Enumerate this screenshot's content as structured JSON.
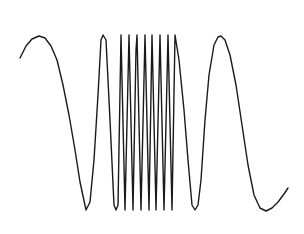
{
  "chart_data": {
    "type": "line",
    "title": "",
    "xlabel": "",
    "ylabel": "",
    "grid": false,
    "legend": null,
    "axes_visible": false,
    "line_color": "#1a1a1a",
    "background": "#ffffff",
    "pixel_frame": {
      "width": 304,
      "height": 234
    },
    "series": [
      {
        "name": "signal",
        "points": [
          [
            20,
            58
          ],
          [
            26,
            46
          ],
          [
            32,
            39
          ],
          [
            39,
            36
          ],
          [
            45,
            38
          ],
          [
            51,
            46
          ],
          [
            57,
            60
          ],
          [
            63,
            85
          ],
          [
            69,
            115
          ],
          [
            75,
            150
          ],
          [
            80,
            182
          ],
          [
            86,
            210
          ],
          [
            90,
            202
          ],
          [
            94,
            160
          ],
          [
            98,
            95
          ],
          [
            101,
            40
          ],
          [
            103,
            35
          ],
          [
            106,
            40
          ],
          [
            110,
            120
          ],
          [
            114,
            205
          ],
          [
            116,
            210
          ],
          [
            118,
            205
          ],
          [
            121,
            35
          ],
          [
            125,
            210
          ],
          [
            129,
            35
          ],
          [
            133,
            210
          ],
          [
            136,
            50
          ],
          [
            137,
            35
          ],
          [
            141,
            210
          ],
          [
            145,
            35
          ],
          [
            149,
            210
          ],
          [
            152,
            35
          ],
          [
            156,
            210
          ],
          [
            160,
            35
          ],
          [
            164,
            210
          ],
          [
            168,
            35
          ],
          [
            172,
            210
          ],
          [
            175,
            35
          ],
          [
            179,
            60
          ],
          [
            184,
            110
          ],
          [
            188,
            160
          ],
          [
            192,
            205
          ],
          [
            195,
            210
          ],
          [
            198,
            205
          ],
          [
            201,
            180
          ],
          [
            205,
            120
          ],
          [
            209,
            75
          ],
          [
            214,
            45
          ],
          [
            218,
            37
          ],
          [
            221,
            36
          ],
          [
            225,
            40
          ],
          [
            230,
            55
          ],
          [
            236,
            85
          ],
          [
            242,
            125
          ],
          [
            248,
            165
          ],
          [
            254,
            195
          ],
          [
            260,
            208
          ],
          [
            266,
            211
          ],
          [
            272,
            208
          ],
          [
            278,
            202
          ],
          [
            284,
            194
          ],
          [
            288,
            188
          ]
        ]
      }
    ],
    "y_range_pixels": {
      "peak": 35,
      "trough": 210
    }
  },
  "labels": {
    "figure_aria": "Line plot of a chirp signal"
  }
}
